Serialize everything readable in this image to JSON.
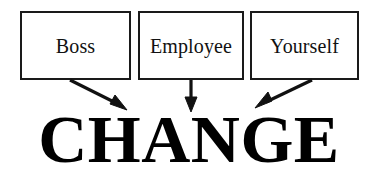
{
  "diagram": {
    "title_text": "CHANGE",
    "background_color": "#ffffff",
    "stroke_color": "#1a1a1a",
    "text_color": "#111111",
    "headline_color": "#000000",
    "boxes": [
      {
        "label": "Boss"
      },
      {
        "label": "Employee"
      },
      {
        "label": "Yourself"
      }
    ],
    "arrows": [
      {
        "name": "boss-to-change",
        "direction": "down-right"
      },
      {
        "name": "employee-to-change",
        "direction": "down"
      },
      {
        "name": "yourself-to-change",
        "direction": "down-left"
      }
    ]
  }
}
